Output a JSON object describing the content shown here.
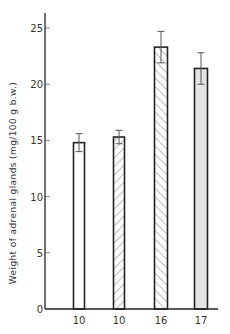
{
  "chart_data": {
    "type": "bar",
    "title": "",
    "xlabel": "",
    "ylabel": "Weight of adrenal glands (mg/100 g b.w.)",
    "ylim": [
      0,
      26
    ],
    "yticks": [
      0,
      5,
      10,
      15,
      20,
      25
    ],
    "grid": false,
    "legend": null,
    "categories": [
      "10",
      "10",
      "16",
      "17"
    ],
    "category_note": "x-axis labels are group sizes (n)",
    "values": [
      14.8,
      15.3,
      23.3,
      21.4
    ],
    "error_upper": [
      15.6,
      15.9,
      24.7,
      22.8
    ],
    "error_lower": [
      14.0,
      14.7,
      21.9,
      20.0
    ],
    "bar_styles": [
      {
        "fill": "#ffffff",
        "pattern": "none"
      },
      {
        "fill": "#ffffff",
        "pattern": "forward-hatch"
      },
      {
        "fill": "#ffffff",
        "pattern": "back-hatch"
      },
      {
        "fill": "#e4e4e4",
        "pattern": "none"
      }
    ]
  },
  "colors": {
    "axis": "#222222",
    "text": "#333333",
    "hatch": "#777777",
    "gray_fill": "#e4e4e4"
  }
}
